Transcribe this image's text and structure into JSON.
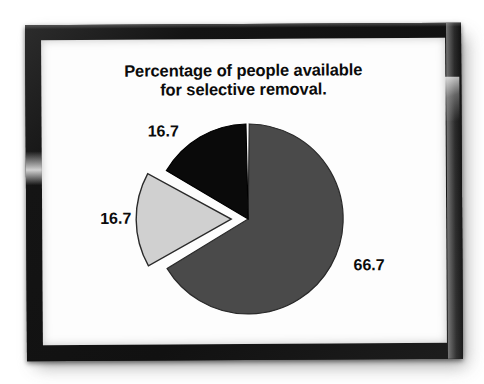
{
  "figure": {
    "kind": "framed-pie-chart-photo",
    "frame_color": "#151515",
    "mat_color": "#fdfdfd"
  },
  "chart_data": {
    "type": "pie",
    "title": "Percentage of people available\nfor selective removal.",
    "categories": [
      "Segment 1",
      "Segment 2",
      "Segment 3"
    ],
    "values": [
      66.7,
      16.7,
      16.7
    ],
    "labels": [
      "66.7",
      "16.7",
      "16.7"
    ],
    "colors": [
      "#4a4a4a",
      "#d0d0d0",
      "#0a0a0a"
    ],
    "exploded": [
      false,
      true,
      false
    ],
    "start_angle_deg": 0,
    "direction": "clockwise",
    "legend": "none",
    "grid": false,
    "xlabel": "",
    "ylabel": "",
    "units": "percent",
    "total": 100.1,
    "slices": [
      {
        "label": "66.7",
        "value": 66.7,
        "color": "#4a4a4a",
        "exploded": false,
        "label_position": "right"
      },
      {
        "label": "16.7",
        "value": 16.7,
        "color": "#d0d0d0",
        "exploded": true,
        "label_position": "left"
      },
      {
        "label": "16.7",
        "value": 16.7,
        "color": "#0a0a0a",
        "exploded": false,
        "label_position": "top-left"
      }
    ]
  }
}
